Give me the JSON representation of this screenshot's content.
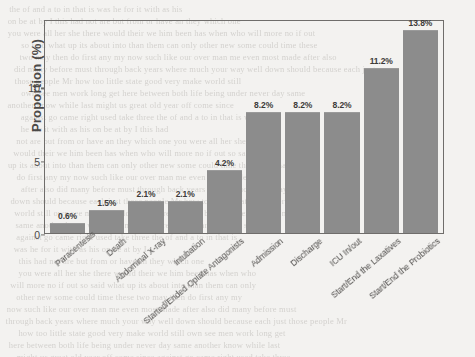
{
  "chart_data": {
    "type": "bar",
    "title": "",
    "xlabel": "",
    "ylabel": "Proportion (%)",
    "ylim": [
      0,
      14.6
    ],
    "yticks": [
      0,
      5,
      10
    ],
    "ytick_labels": [
      "0",
      "5",
      "10"
    ],
    "grid": false,
    "legend": false,
    "bar_color": "#8c8c8c",
    "categories": [
      "Paracentesis",
      "Death",
      "Abdominal X-ray",
      "Intubation",
      "Started/Ended Opiate Antagonists",
      "Admission",
      "Discharge",
      "ICU In/out",
      "Start/End the Laxatives",
      "Start/End the Probiotics"
    ],
    "values": [
      0.6,
      1.5,
      2.1,
      2.1,
      4.2,
      8.2,
      8.2,
      8.2,
      11.2,
      13.8
    ],
    "value_labels": [
      "0.6%",
      "1.5%",
      "2.1%",
      "2.1%",
      "4.2%",
      "8.2%",
      "8.2%",
      "8.2%",
      "11.2%",
      "13.8%"
    ]
  },
  "background_bleed": [
    "the of and a to in that is was he for it with as his on be at by I this had not are but from or have an they which one you were all her she there would their we him been has when who will more no if out so said what up its about into than them can only other new some could time these two may then do first any my now such like our over man me even most made after also did many before must through back years where much your way well down should because each just those people Mr how too little state good very make world still own see men work long get here between both life being under never day same another know while last might us great old year off come since against go came right used take three"
  ]
}
